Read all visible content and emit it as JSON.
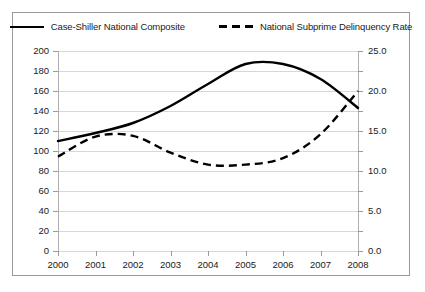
{
  "legend": {
    "entries": [
      {
        "label": "Case-Shiller National Composite",
        "style": "solid",
        "color": "#000000"
      },
      {
        "label": "National Subprime Delinquency Rate",
        "style": "dashed",
        "color": "#000000"
      }
    ]
  },
  "axes": {
    "x_tick_labels": [
      "2000",
      "2001",
      "2002",
      "2003",
      "2004",
      "2005",
      "2006",
      "2007",
      "2008"
    ],
    "y_left_tick_labels": [
      "0",
      "20",
      "40",
      "60",
      "80",
      "100",
      "120",
      "140",
      "160",
      "180",
      "200"
    ],
    "y_right_tick_labels": [
      "0.0",
      "5.0",
      "10.0",
      "15.0",
      "20.0",
      "25.0"
    ]
  },
  "chart_data": {
    "type": "line",
    "title": "",
    "subtitle": "",
    "xlabel": "",
    "ylabel": "",
    "y2label": "",
    "grid": true,
    "legend_position": "top",
    "x": [
      2000,
      2001,
      2002,
      2003,
      2004,
      2005,
      2006,
      2007,
      2008
    ],
    "xlim": [
      2000,
      2008
    ],
    "ylim": [
      0,
      200
    ],
    "y2lim": [
      0.0,
      25.0
    ],
    "y_left_ticks": [
      0,
      20,
      40,
      60,
      80,
      100,
      120,
      140,
      160,
      180,
      200
    ],
    "y_right_ticks": [
      0.0,
      5.0,
      10.0,
      15.0,
      20.0,
      25.0
    ],
    "series": [
      {
        "name": "Case-Shiller National Composite",
        "axis": "left",
        "style": "solid",
        "color": "#000000",
        "values": [
          110,
          118,
          128,
          145,
          167,
          187,
          187,
          172,
          143
        ]
      },
      {
        "name": "National Subprime Delinquency Rate",
        "axis": "right",
        "style": "dashed",
        "color": "#000000",
        "values": [
          11.8,
          14.3,
          14.4,
          12.3,
          10.8,
          10.8,
          11.6,
          14.6,
          20.0
        ]
      }
    ]
  }
}
